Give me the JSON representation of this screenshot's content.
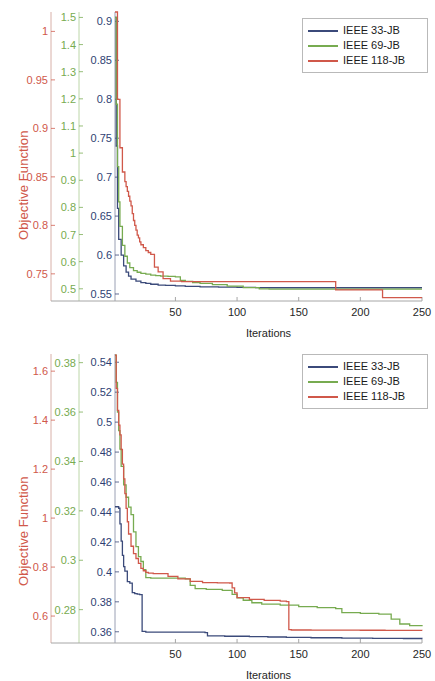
{
  "colors": {
    "series_33": "#3b4a7a",
    "series_69": "#77ab50",
    "series_118": "#d0584a",
    "axis_red": "#d0584a",
    "axis_green": "#77ab50",
    "axis_blue": "#2f3f73",
    "axis_gray": "#a6a6a6",
    "legend_border": "#b9b9b9",
    "text": "#262626"
  },
  "legend": {
    "items": [
      {
        "label": "IEEE 33-JB",
        "color": "#3b4a7a"
      },
      {
        "label": "IEEE 69-JB",
        "color": "#77ab50"
      },
      {
        "label": "IEEE 118-JB",
        "color": "#d0584a"
      }
    ]
  },
  "chart_data": [
    {
      "id": "chart-top",
      "type": "line",
      "title": "",
      "xlabel": "Iterations",
      "ylabel": "Objective Function",
      "grid": false,
      "legend_position": "top-right",
      "xlim": [
        1,
        250
      ],
      "xticks": [
        50,
        100,
        150,
        200,
        250
      ],
      "axes": [
        {
          "name": "IEEE 118-JB",
          "color": "#d0584a",
          "ticks": [
            1,
            0.95,
            0.9,
            0.85,
            0.8,
            0.75
          ],
          "ylim": [
            0.722,
            1.02
          ]
        },
        {
          "name": "IEEE 69-JB",
          "color": "#77ab50",
          "ticks": [
            1.5,
            1.4,
            1.3,
            1.2,
            1.1,
            1,
            0.9,
            0.8,
            0.7,
            0.6,
            0.5
          ],
          "ylim": [
            0.455,
            1.52
          ]
        },
        {
          "name": "IEEE 33-JB",
          "color": "#2f3f73",
          "ticks": [
            0.9,
            0.85,
            0.8,
            0.75,
            0.7,
            0.65,
            0.6,
            0.55
          ],
          "ylim": [
            0.541,
            0.912
          ]
        }
      ],
      "series": [
        {
          "name": "IEEE 33-JB",
          "color": "#3b4a7a",
          "axis": 2,
          "x": [
            1,
            2,
            3,
            4,
            6,
            8,
            10,
            12,
            14,
            18,
            22,
            26,
            30,
            36,
            42,
            50,
            58,
            70,
            85,
            100,
            115,
            126,
            140,
            170,
            200,
            230,
            250
          ],
          "y": [
            0.905,
            0.74,
            0.66,
            0.62,
            0.6,
            0.586,
            0.578,
            0.573,
            0.569,
            0.5665,
            0.5645,
            0.5635,
            0.5625,
            0.5615,
            0.561,
            0.5605,
            0.5598,
            0.5592,
            0.5588,
            0.5585,
            0.5582,
            0.558,
            0.558,
            0.558,
            0.558,
            0.558,
            0.558
          ]
        },
        {
          "name": "IEEE 69-JB",
          "color": "#77ab50",
          "axis": 1,
          "x": [
            1,
            2,
            3,
            4,
            5,
            7,
            9,
            11,
            13,
            16,
            19,
            22,
            26,
            30,
            34,
            38,
            44,
            50,
            54,
            58,
            64,
            70,
            80,
            92,
            105,
            118,
            126,
            140,
            170,
            200,
            230,
            250
          ],
          "y": [
            1.5,
            1.18,
            0.95,
            0.82,
            0.73,
            0.66,
            0.62,
            0.595,
            0.578,
            0.567,
            0.561,
            0.557,
            0.554,
            0.5505,
            0.5485,
            0.547,
            0.5455,
            0.544,
            0.5305,
            0.5275,
            0.5225,
            0.52,
            0.515,
            0.51,
            0.504,
            0.5,
            0.4985,
            0.4985,
            0.4985,
            0.4985,
            0.4985,
            0.4985
          ]
        },
        {
          "name": "IEEE 118-JB",
          "color": "#d0584a",
          "axis": 0,
          "x": [
            1,
            3,
            5,
            7,
            9,
            10,
            11,
            12,
            13,
            14,
            15,
            16,
            17,
            18,
            19,
            20,
            21,
            22,
            24,
            26,
            28,
            30,
            33,
            36,
            40,
            46,
            55,
            70,
            90,
            110,
            130,
            150,
            170,
            178,
            180,
            195,
            210,
            216,
            218,
            230,
            250
          ],
          "y": [
            1.02,
            0.93,
            0.88,
            0.855,
            0.845,
            0.84,
            0.835,
            0.83,
            0.825,
            0.82,
            0.812,
            0.805,
            0.8,
            0.795,
            0.79,
            0.787,
            0.783,
            0.78,
            0.777,
            0.774,
            0.772,
            0.77,
            0.757,
            0.752,
            0.745,
            0.7425,
            0.742,
            0.742,
            0.742,
            0.742,
            0.742,
            0.742,
            0.742,
            0.742,
            0.7335,
            0.7335,
            0.7335,
            0.7335,
            0.7255,
            0.7255,
            0.7255
          ]
        }
      ]
    },
    {
      "id": "chart-bottom",
      "type": "line",
      "title": "",
      "xlabel": "Iterations",
      "ylabel": "Objective Function",
      "grid": false,
      "legend_position": "top-right",
      "xlim": [
        1,
        250
      ],
      "xticks": [
        50,
        100,
        150,
        200,
        250
      ],
      "axes": [
        {
          "name": "IEEE 118-JB",
          "color": "#d0584a",
          "ticks": [
            1.6,
            1.4,
            1.2,
            1,
            0.8,
            0.6
          ],
          "ylim": [
            0.49,
            1.67
          ]
        },
        {
          "name": "IEEE 69-JB",
          "color": "#77ab50",
          "ticks": [
            0.38,
            0.36,
            0.34,
            0.32,
            0.3,
            0.28
          ],
          "ylim": [
            0.2665,
            0.3835
          ]
        },
        {
          "name": "IEEE 33-JB",
          "color": "#2f3f73",
          "ticks": [
            0.54,
            0.52,
            0.5,
            0.48,
            0.46,
            0.44,
            0.42,
            0.4,
            0.38,
            0.36
          ],
          "ylim": [
            0.3525,
            0.5455
          ]
        }
      ],
      "series": [
        {
          "name": "IEEE 33-JB",
          "color": "#3b4a7a",
          "axis": 2,
          "x": [
            1,
            2,
            3,
            4,
            5,
            6,
            7,
            8,
            9,
            11,
            13,
            15,
            17,
            19,
            21,
            23,
            26,
            40,
            55,
            70,
            74,
            76,
            90,
            110,
            125,
            140,
            160,
            185,
            210,
            235,
            250
          ],
          "y": [
            0.4435,
            0.4435,
            0.4435,
            0.4425,
            0.432,
            0.4205,
            0.411,
            0.4035,
            0.4005,
            0.3935,
            0.3925,
            0.3862,
            0.3855,
            0.3852,
            0.3848,
            0.3602,
            0.3598,
            0.3598,
            0.3598,
            0.3597,
            0.3594,
            0.3573,
            0.357,
            0.3568,
            0.3565,
            0.3562,
            0.356,
            0.3558,
            0.3556,
            0.3555,
            0.3554
          ]
        },
        {
          "name": "IEEE 69-JB",
          "color": "#77ab50",
          "axis": 1,
          "x": [
            1,
            2,
            3,
            4,
            5,
            6,
            8,
            10,
            12,
            14,
            16,
            18,
            20,
            22,
            24,
            26,
            30,
            40,
            50,
            58,
            62,
            66,
            75,
            88,
            96,
            100,
            105,
            112,
            120,
            135,
            150,
            165,
            180,
            185,
            200,
            215,
            225,
            232,
            240,
            250
          ],
          "y": [
            0.383,
            0.372,
            0.36,
            0.3525,
            0.345,
            0.338,
            0.3305,
            0.3255,
            0.3215,
            0.3185,
            0.3115,
            0.3055,
            0.3015,
            0.2995,
            0.2962,
            0.293,
            0.2928,
            0.2928,
            0.2928,
            0.2925,
            0.2898,
            0.2885,
            0.2882,
            0.2878,
            0.2862,
            0.2848,
            0.2838,
            0.2828,
            0.2822,
            0.2818,
            0.2812,
            0.2808,
            0.2804,
            0.2788,
            0.2785,
            0.2782,
            0.2762,
            0.2742,
            0.2735,
            0.2733
          ]
        },
        {
          "name": "IEEE 118-JB",
          "color": "#d0584a",
          "axis": 0,
          "x": [
            1,
            2,
            3,
            4,
            5,
            6,
            7,
            8,
            9,
            10,
            11,
            12,
            14,
            16,
            18,
            20,
            22,
            24,
            26,
            28,
            32,
            38,
            44,
            52,
            62,
            72,
            84,
            94,
            96,
            98,
            100,
            110,
            122,
            135,
            140,
            142,
            144,
            160,
            180,
            200,
            220,
            240,
            250
          ],
          "y": [
            1.665,
            1.53,
            1.44,
            1.38,
            1.34,
            1.28,
            1.22,
            1.16,
            1.1,
            1.04,
            0.985,
            0.935,
            0.885,
            0.855,
            0.835,
            0.815,
            0.795,
            0.785,
            0.778,
            0.775,
            0.7735,
            0.7735,
            0.762,
            0.752,
            0.742,
            0.7365,
            0.7355,
            0.735,
            0.715,
            0.695,
            0.675,
            0.668,
            0.664,
            0.661,
            0.659,
            0.545,
            0.543,
            0.5425,
            0.5422,
            0.542,
            0.5418,
            0.5415,
            0.5412
          ]
        }
      ]
    }
  ]
}
